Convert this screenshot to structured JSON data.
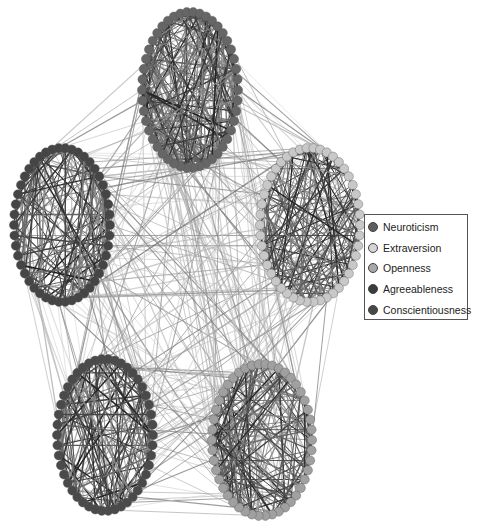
{
  "legend": {
    "items": [
      {
        "label": "Neuroticism",
        "color": "#5e5e5e"
      },
      {
        "label": "Extraversion",
        "color": "#d4d4d4"
      },
      {
        "label": "Openness",
        "color": "#a8a8a8"
      },
      {
        "label": "Agreeableness",
        "color": "#3c3c3c"
      },
      {
        "label": "Conscientiousness",
        "color": "#484848"
      }
    ]
  },
  "clusters": [
    {
      "name": "Neuroticism",
      "cx": 190,
      "cy": 90,
      "rx": 48,
      "ry": 78,
      "color": "#666666",
      "edge": "#2a2a2a"
    },
    {
      "name": "Extraversion",
      "cx": 310,
      "cy": 225,
      "rx": 50,
      "ry": 77,
      "color": "#c8c8c8",
      "edge": "#333333"
    },
    {
      "name": "Agreeableness",
      "cx": 62,
      "cy": 225,
      "rx": 48,
      "ry": 77,
      "color": "#454545",
      "edge": "#333333"
    },
    {
      "name": "Conscientiousness",
      "cx": 105,
      "cy": 435,
      "rx": 48,
      "ry": 76,
      "color": "#4a4a4a",
      "edge": "#333333"
    },
    {
      "name": "Openness",
      "cx": 262,
      "cy": 440,
      "rx": 50,
      "ry": 76,
      "color": "#a0a0a0",
      "edge": "#333333"
    }
  ]
}
